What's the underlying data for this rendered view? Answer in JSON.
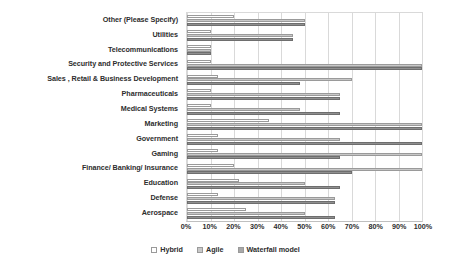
{
  "chart_data": {
    "type": "bar",
    "orientation": "horizontal",
    "title": "",
    "xlabel": "",
    "ylabel": "",
    "xlim": [
      0,
      100
    ],
    "xticks": [
      "0%",
      "10%",
      "20%",
      "30%",
      "40%",
      "50%",
      "60%",
      "70%",
      "80%",
      "90%",
      "100%"
    ],
    "xtick_values": [
      0,
      10,
      20,
      30,
      40,
      50,
      60,
      70,
      80,
      90,
      100
    ],
    "grid": true,
    "legend_position": "bottom",
    "categories": [
      "Other (Please Specify)",
      "Utilities",
      "Telecommunications",
      "Security and Protective Services",
      "Sales , Retail & Business Development",
      "Pharmaceuticals",
      "Medical Systems",
      "Marketing",
      "Government",
      "Gaming",
      "Finance/ Banking/ Insurance",
      "Education",
      "Defense",
      "Aerospace"
    ],
    "series": [
      {
        "name": "Hybrid",
        "color": "#ffffff",
        "values": [
          20,
          10,
          10,
          10,
          13,
          10,
          10,
          35,
          13,
          13,
          20,
          22,
          13,
          25
        ]
      },
      {
        "name": "Agile",
        "color": "#c8c8c8",
        "values": [
          50,
          45,
          10,
          100,
          70,
          65,
          48,
          100,
          65,
          100,
          100,
          50,
          63,
          50
        ]
      },
      {
        "name": "Waterfall model",
        "color": "#a8a8a8",
        "values": [
          50,
          45,
          10,
          100,
          48,
          65,
          65,
          100,
          100,
          65,
          70,
          65,
          63,
          63
        ]
      }
    ]
  },
  "legend": {
    "items": [
      {
        "label": "Hybrid",
        "key": "hybrid"
      },
      {
        "label": "Agile",
        "key": "agile"
      },
      {
        "label": "Waterfall model",
        "key": "waterfall"
      }
    ]
  }
}
